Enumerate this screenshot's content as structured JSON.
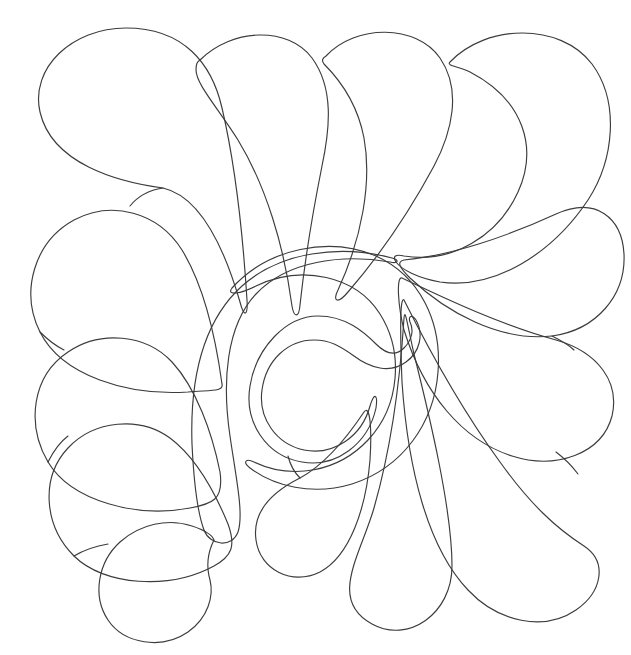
{
  "document": {
    "kind": "line-art-drawing",
    "subject": "feather plume quilting motif",
    "title": "",
    "background_color": "#ffffff",
    "stroke_color": "#3c3c3c",
    "stroke_width": 1.15,
    "canvas": {
      "width": 631,
      "height": 655
    },
    "text_content": [],
    "labels": [],
    "has_border": false,
    "fill": "none"
  },
  "drawing": {
    "description": "Symmetrical fan of teardrop petals radiating around a central spiral, with a tapered spine curling toward the lower-left.",
    "motif_count": 14,
    "center_spiral": {
      "name": "central-spiral",
      "inner_circle_center": [
        314,
        372
      ],
      "inner_circle_radius": 56,
      "outer_turn_radius": 125,
      "turns": 1.6
    },
    "spine": {
      "name": "feather-spine",
      "start": [
        392,
        258
      ],
      "tip": [
        213,
        541
      ],
      "max_width": 26
    },
    "petals": [
      {
        "id": "petal-tl-outer",
        "group": "top-left",
        "anchor": [
          118,
          138
        ],
        "radius": 84,
        "tip": [
          247,
          300
        ]
      },
      {
        "id": "petal-top-1",
        "group": "top",
        "anchor": [
          252,
          110
        ],
        "radius": 78,
        "tip": [
          300,
          305
        ]
      },
      {
        "id": "petal-top-2",
        "group": "top",
        "anchor": [
          380,
          102
        ],
        "radius": 80,
        "tip": [
          340,
          300
        ]
      },
      {
        "id": "petal-top-3",
        "group": "top-right",
        "anchor": [
          520,
          120
        ],
        "radius": 92,
        "tip": [
          396,
          262
        ]
      },
      {
        "id": "petal-right-1",
        "group": "right",
        "anchor": [
          562,
          262
        ],
        "radius": 72,
        "tip": [
          398,
          264
        ]
      },
      {
        "id": "petal-right-2",
        "group": "right",
        "anchor": [
          560,
          388
        ],
        "radius": 74,
        "tip": [
          400,
          282
        ]
      },
      {
        "id": "petal-right-3",
        "group": "right",
        "anchor": [
          540,
          520
        ],
        "radius": 82,
        "tip": [
          404,
          300
        ]
      },
      {
        "id": "petal-br-1",
        "group": "bottom",
        "anchor": [
          376,
          556
        ],
        "radius": 70,
        "tip": [
          404,
          318
        ]
      },
      {
        "id": "petal-br-2",
        "group": "bottom",
        "anchor": [
          300,
          492
        ],
        "radius": 56,
        "tip": [
          364,
          410
        ]
      },
      {
        "id": "petal-left-1",
        "group": "left",
        "anchor": [
          78,
          266
        ],
        "radius": 66,
        "tip": [
          222,
          382
        ]
      },
      {
        "id": "petal-left-2",
        "group": "left",
        "anchor": [
          70,
          392
        ],
        "radius": 66,
        "tip": [
          218,
          470
        ]
      },
      {
        "id": "petal-left-3",
        "group": "left",
        "anchor": [
          86,
          500
        ],
        "radius": 70,
        "tip": [
          226,
          522
        ]
      },
      {
        "id": "petal-bl-curl",
        "group": "bottom-left",
        "anchor": [
          152,
          578
        ],
        "radius": 60,
        "tip": [
          214,
          540
        ]
      }
    ],
    "palette": {
      "line": "#3c3c3c",
      "paper": "#ffffff"
    }
  }
}
